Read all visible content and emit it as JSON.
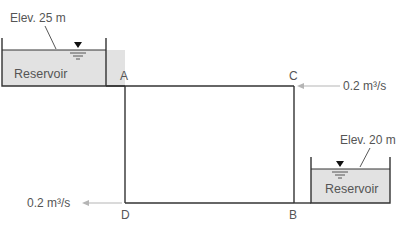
{
  "diagram": {
    "type": "pipe-network",
    "nodes": [
      {
        "id": "A",
        "label": "A"
      },
      {
        "id": "B",
        "label": "B"
      },
      {
        "id": "C",
        "label": "C"
      },
      {
        "id": "D",
        "label": "D"
      }
    ],
    "pipes": [
      [
        "A",
        "C"
      ],
      [
        "C",
        "B"
      ],
      [
        "B",
        "D"
      ],
      [
        "D",
        "A"
      ]
    ],
    "reservoirs": [
      {
        "label": "Reservoir",
        "elevation": "Elev. 25 m",
        "connects_to": "A"
      },
      {
        "label": "Reservoir",
        "elevation": "Elev. 20 m",
        "connects_to": "B"
      }
    ],
    "flows": [
      {
        "node": "C",
        "value": "0.2 m³/s",
        "direction": "inflow"
      },
      {
        "node": "D",
        "value": "0.2 m³/s",
        "direction": "outflow"
      }
    ],
    "colors": {
      "pipe": "#333333",
      "reservoir_fill": "#e2e2e2",
      "arrow": "#b5b5b5",
      "text": "#555555"
    }
  }
}
